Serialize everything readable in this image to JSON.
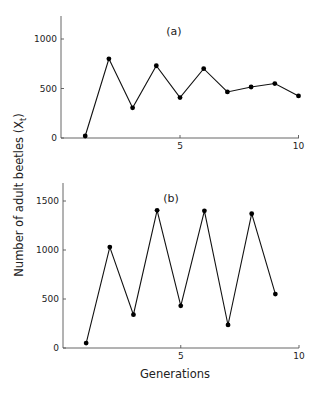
{
  "chart_data": [
    {
      "type": "line",
      "panel_label": "(a)",
      "x": [
        1,
        2,
        3,
        4,
        5,
        6,
        7,
        8,
        9,
        10
      ],
      "values": [
        20,
        800,
        305,
        730,
        408,
        700,
        465,
        515,
        550,
        425
      ],
      "xlabel": "",
      "ylabel": "Number of adult beetles (Xt)",
      "xlim": [
        0,
        10
      ],
      "ylim": [
        0,
        1200
      ],
      "xticks": [
        5,
        10
      ],
      "yticks": [
        0,
        500,
        1000
      ],
      "grid": false,
      "markers": true
    },
    {
      "type": "line",
      "panel_label": "(b)",
      "x": [
        1,
        2,
        3,
        4,
        5,
        6,
        7,
        8,
        9
      ],
      "values": [
        50,
        1030,
        340,
        1405,
        430,
        1400,
        235,
        1370,
        550
      ],
      "xlabel": "Generations",
      "ylabel": "Number of adult beetles (Xt)",
      "xlim": [
        0,
        10
      ],
      "ylim": [
        0,
        1700
      ],
      "xticks": [
        5,
        10
      ],
      "yticks": [
        0,
        500,
        1000,
        1500
      ],
      "grid": false,
      "markers": true
    }
  ],
  "labels": {
    "ylabel_main": "Number of adult beetles (X",
    "ylabel_sub": "t",
    "ylabel_close": ")",
    "xlabel": "Generations"
  },
  "colors": {
    "line": "#111111",
    "axis": "#555555",
    "background": "#ffffff"
  }
}
